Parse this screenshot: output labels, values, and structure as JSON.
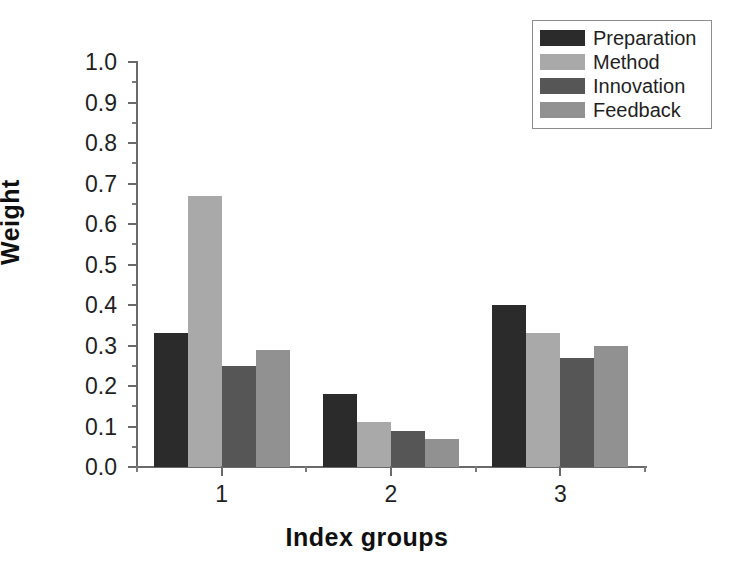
{
  "chart_data": {
    "type": "bar",
    "title": "",
    "subtitle": "",
    "xlabel": "Index groups",
    "ylabel": "Weight",
    "categories": [
      "1",
      "2",
      "3"
    ],
    "ylim": [
      0.0,
      1.0
    ],
    "ytick_labels": [
      "0.0",
      "0.1",
      "0.2",
      "0.3",
      "0.4",
      "0.5",
      "0.6",
      "0.7",
      "0.8",
      "0.9",
      "1.0"
    ],
    "ytick_values": [
      0.0,
      0.1,
      0.2,
      0.3,
      0.4,
      0.5,
      0.6,
      0.7,
      0.8,
      0.9,
      1.0
    ],
    "minor_ticks": true,
    "grid": false,
    "legend_position": "top-right",
    "series": [
      {
        "name": "Preparation",
        "color": "#2b2b2b",
        "values": [
          0.33,
          0.18,
          0.4
        ]
      },
      {
        "name": "Method",
        "color": "#a9a9a9",
        "values": [
          0.67,
          0.11,
          0.33
        ]
      },
      {
        "name": "Innovation",
        "color": "#565656",
        "values": [
          0.25,
          0.09,
          0.27
        ]
      },
      {
        "name": "Feedback",
        "color": "#919191",
        "values": [
          0.29,
          0.07,
          0.3
        ]
      }
    ]
  },
  "axis": {
    "y_title": "Weight",
    "x_title": "Index groups",
    "axis_color": "#6a6a6a"
  },
  "legend": {
    "items": [
      {
        "label": "Preparation",
        "swatch": "#2b2b2b"
      },
      {
        "label": "Method",
        "swatch": "#a9a9a9"
      },
      {
        "label": "Innovation",
        "swatch": "#565656"
      },
      {
        "label": "Feedback",
        "swatch": "#919191"
      }
    ]
  }
}
